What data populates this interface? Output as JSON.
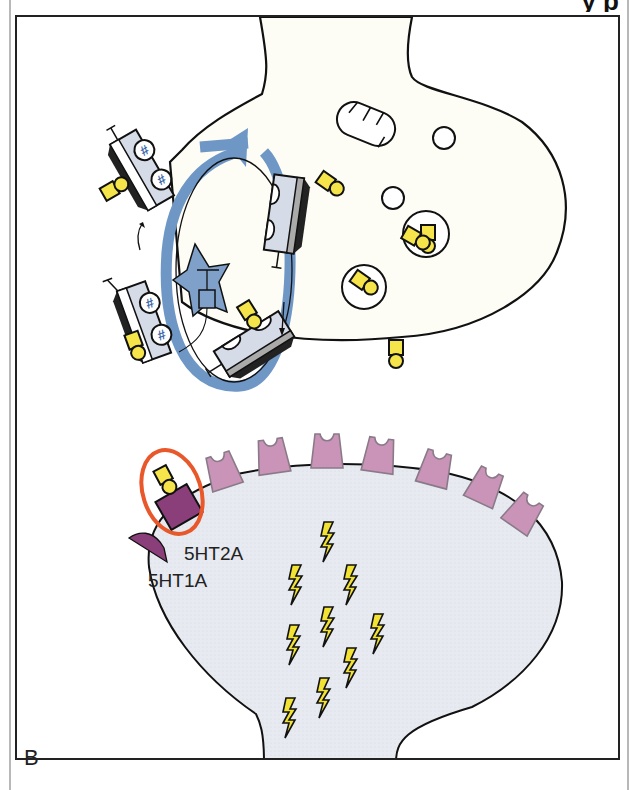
{
  "header": {
    "title_fragment": "y                           p"
  },
  "figure": {
    "panel_label": "B",
    "colors": {
      "serotonin": "#f5e44a",
      "transporter_blue": "#6f97c6",
      "transporter_body": "#d6dbe8",
      "receptor_5ht2a": "#c994b8",
      "receptor_5ht1a": "#8b3f7a",
      "highlight_ring": "#e8582a",
      "postsynaptic_fill": "#e7eaf0",
      "presynaptic_fill": "#fdfdf6",
      "lightning": "#f2e233"
    },
    "labels": {
      "receptor_a": "5HT2A",
      "receptor_b": "5HT1A"
    },
    "elements": {
      "presynaptic_terminal": "presynaptic-neuron",
      "postsynaptic_neuron": "postsynaptic-neuron",
      "reuptake_cycle_arrow": "recycling-arrow",
      "mitochondrion": "mitochondrion",
      "vesicle_count": 4,
      "free_serotonin_count": 2,
      "transporter_count": 4,
      "postsynaptic_receptor_count": 9,
      "lightning_bolt_count": 12
    }
  }
}
